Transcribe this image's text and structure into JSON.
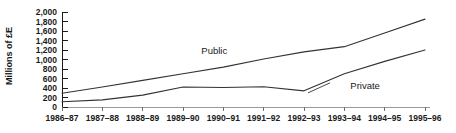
{
  "chart_data": {
    "type": "line",
    "title": "",
    "subtitle": "",
    "xlabel": "",
    "ylabel": "Millions of £E",
    "categories": [
      "1986–87",
      "1987–88",
      "1988–89",
      "1989–90",
      "1990–91",
      "1991–92",
      "1992–93",
      "1993–94",
      "1994–95",
      "1995–96"
    ],
    "ylim": [
      0,
      2000
    ],
    "yticks": [
      0,
      200,
      400,
      600,
      800,
      1000,
      1200,
      1400,
      1600,
      1800,
      2000
    ],
    "ytick_labels": [
      "0",
      "200",
      "400",
      "600",
      "800",
      "1,000",
      "1,200",
      "1,400",
      "1,600",
      "1,800",
      "2,000"
    ],
    "grid": false,
    "legend": "inline-annotations",
    "series": [
      {
        "name": "Public",
        "color": "#333333",
        "values": [
          290,
          420,
          560,
          700,
          840,
          1010,
          1160,
          1270,
          1560,
          1850
        ]
      },
      {
        "name": "Private",
        "color": "#333333",
        "values": [
          110,
          150,
          250,
          420,
          410,
          425,
          340,
          700,
          960,
          1200
        ]
      }
    ],
    "annotations": [
      {
        "text": "Public",
        "series": "Public",
        "x_index": 4
      },
      {
        "text": "Private",
        "series": "Private",
        "x_index": 7
      }
    ]
  },
  "axis": {
    "axis_color": "#1a1a1a",
    "plot_background": "#ffffff"
  }
}
